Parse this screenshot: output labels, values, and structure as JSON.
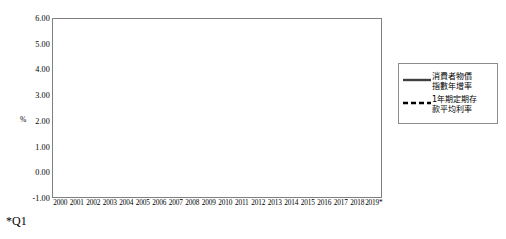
{
  "chart_data": {
    "type": "line",
    "title": "",
    "xlabel": "",
    "ylabel": "%",
    "ylim": [
      -1.0,
      6.0
    ],
    "ytick_step": 1.0,
    "yticks": [
      "6.00",
      "5.00",
      "4.00",
      "3.00",
      "2.00",
      "1.00",
      "0.00",
      "-1.00"
    ],
    "ytick_values": [
      6,
      5,
      4,
      3,
      2,
      1,
      0,
      -1
    ],
    "grid": true,
    "grid_axis": "y",
    "legend_position": "right-outside",
    "categories": [
      "2000",
      "2001",
      "2002",
      "2003",
      "2004",
      "2005",
      "2006",
      "2007",
      "2008",
      "2009",
      "2010",
      "2011",
      "2012",
      "2013",
      "2014",
      "2015",
      "2016",
      "2017",
      "2018",
      "2019*"
    ],
    "series": [
      {
        "name": "消費者物價指數年增率",
        "style": "solid",
        "color": "#404040",
        "values": [
          1.3,
          -0.1,
          -0.3,
          -0.3,
          1.6,
          2.3,
          0.6,
          1.8,
          3.5,
          -0.9,
          0.95,
          1.4,
          1.9,
          0.8,
          1.2,
          -0.3,
          1.4,
          0.6,
          1.35,
          1.0
        ]
      },
      {
        "name": "1年期定期存款平均利率",
        "style": "dashed",
        "color": "#000000",
        "values": [
          5.0,
          2.4,
          1.9,
          1.4,
          1.4,
          1.7,
          2.2,
          2.6,
          2.7,
          0.9,
          1.05,
          1.25,
          1.35,
          1.35,
          1.35,
          1.2,
          1.1,
          1.05,
          0.25,
          1.05
        ]
      }
    ]
  },
  "legend": {
    "entries": [
      {
        "line1": "消費者物價",
        "line2": "指數年增率",
        "dash": false
      },
      {
        "line1": "1年期定期存",
        "line2": "款平均利率",
        "dash": true
      }
    ]
  },
  "footnote": "*Q1"
}
